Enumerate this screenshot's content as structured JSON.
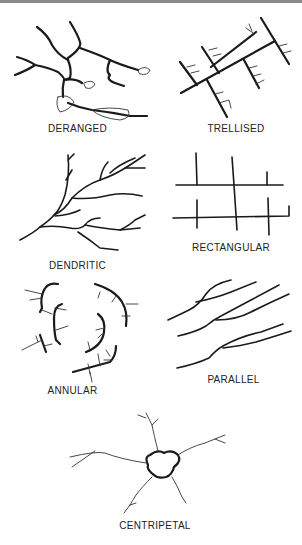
{
  "figure": {
    "panels": [
      {
        "id": "deranged",
        "label": "DERANGED"
      },
      {
        "id": "trellised",
        "label": "TRELLISED"
      },
      {
        "id": "dendritic",
        "label": "DENDRITIC"
      },
      {
        "id": "rectangular",
        "label": "RECTANGULAR"
      },
      {
        "id": "annular",
        "label": "ANNULAR"
      },
      {
        "id": "parallel",
        "label": "PARALLEL"
      },
      {
        "id": "centripetal",
        "label": "CENTRIPETAL"
      }
    ]
  },
  "colors": {
    "ink": "#1a1a1a",
    "background": "#ffffff",
    "topbar": "#8a8a8a"
  }
}
